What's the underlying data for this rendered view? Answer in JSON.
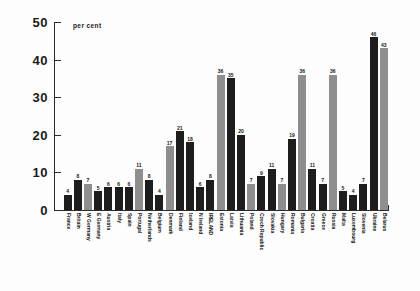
{
  "chart_data": {
    "type": "bar",
    "title": "",
    "subtitle": "",
    "unit_label": "per cent",
    "xlabel": "",
    "ylabel": "per cent",
    "ylim": [
      0,
      50
    ],
    "ytick_labels": [
      "0",
      "10",
      "20",
      "30",
      "40",
      "50"
    ],
    "ytick_values": [
      0,
      10,
      20,
      30,
      40,
      50
    ],
    "grid": false,
    "legend": "none",
    "categories": [
      "France",
      "Britain",
      "W Germany",
      "E Germany",
      "Austria",
      "Italy",
      "Spain",
      "Portugal",
      "Netherlands",
      "Belgium",
      "Denmark",
      "Finland",
      "Iceland",
      "N Ireland",
      "IRELAND",
      "Estonia",
      "Latvia",
      "Lithuania",
      "Poland",
      "Czech Republic",
      "Slovakia",
      "Hungary",
      "Romania",
      "Bulgaria",
      "Croatia",
      "Greece",
      "Russia",
      "Malta",
      "Luxembourg",
      "Slovenia",
      "Ukraine",
      "Belarus"
    ],
    "values": [
      4,
      8,
      7,
      5,
      6,
      6,
      6,
      11,
      8,
      4,
      17,
      21,
      18,
      6,
      8,
      36,
      35,
      20,
      7,
      9,
      11,
      7,
      19,
      36,
      11,
      7,
      36,
      5,
      4,
      7,
      46,
      43
    ],
    "bar_shades": [
      "dark",
      "dark",
      "light",
      "dark",
      "dark",
      "dark",
      "dark",
      "light",
      "dark",
      "dark",
      "light",
      "dark",
      "dark",
      "dark",
      "dark",
      "light",
      "dark",
      "dark",
      "light",
      "dark",
      "dark",
      "light",
      "dark",
      "light",
      "dark",
      "dark",
      "light",
      "dark",
      "dark",
      "dark",
      "dark",
      "light"
    ],
    "highlight_category": "IRELAND",
    "colors": {
      "bar_dark": "#1d1d1d",
      "bar_light": "#8e8e8e",
      "axis": "#2b2b2b",
      "text": "#141414",
      "background": "#fdfdfd"
    }
  }
}
